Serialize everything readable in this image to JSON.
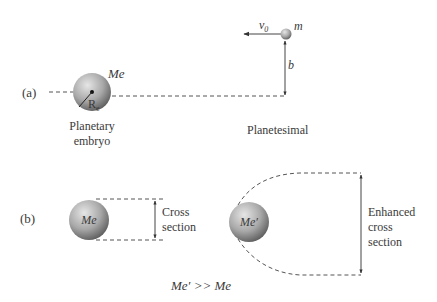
{
  "panel_a": {
    "label": "(a)",
    "embryo": {
      "mass_label": "Me",
      "radius_label": "R",
      "radius_sub": "e",
      "name_line1": "Planetary",
      "name_line2": "embryo"
    },
    "planetesimal": {
      "mass_label": "m",
      "velocity_label": "v",
      "velocity_sub": "0",
      "impact_param_label": "b",
      "name": "Planetesimal"
    }
  },
  "panel_b": {
    "label": "(b)",
    "left_body_label": "Me",
    "left_caption_line1": "Cross",
    "left_caption_line2": "section",
    "right_body_label": "Me′",
    "right_caption_line1": "Enhanced",
    "right_caption_line2": "cross",
    "right_caption_line3": "section",
    "relation": "Me′ >> Me"
  },
  "colors": {
    "line": "#555555",
    "text": "#3a3a3a",
    "sphere_light": "#d8d8d8",
    "sphere_dark": "#6a6a6a"
  }
}
